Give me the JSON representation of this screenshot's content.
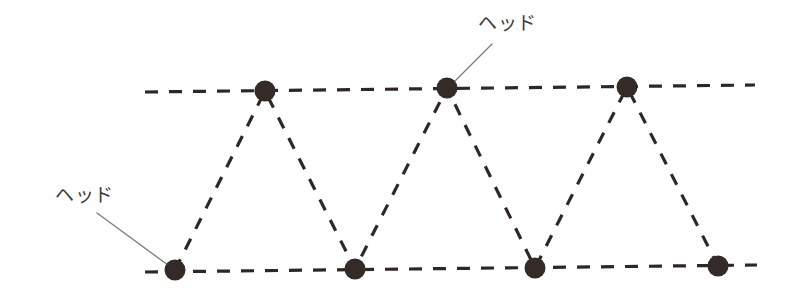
{
  "diagram": {
    "background_color": "#ffffff",
    "node_color": "#342a28",
    "line_color": "#2f2724",
    "leader_color": "#7d7a78",
    "text_color": "#413a39",
    "width": 791,
    "height": 306,
    "labels": [
      {
        "id": "head-top",
        "text": "ヘッド",
        "x": 478,
        "y": 14,
        "leader": {
          "x1": 492,
          "y1": 44,
          "x2": 452,
          "y2": 84
        }
      },
      {
        "id": "head-bottom",
        "text": "ヘッド",
        "x": 55,
        "y": 186,
        "leader": {
          "x1": 97,
          "y1": 213,
          "x2": 172,
          "y2": 268
        }
      }
    ],
    "rails": [
      {
        "id": "top-rail",
        "x1": 145,
        "y1": 92,
        "x2": 755,
        "y2": 85
      },
      {
        "id": "bottom-rail",
        "x1": 145,
        "y1": 272,
        "x2": 757,
        "y2": 265
      }
    ],
    "nodes_top": [
      {
        "id": "top-node-1",
        "x": 265,
        "y": 91,
        "r": 10
      },
      {
        "id": "top-node-2",
        "x": 447,
        "y": 88,
        "r": 10
      },
      {
        "id": "top-node-3",
        "x": 627,
        "y": 87,
        "r": 10
      }
    ],
    "nodes_bottom": [
      {
        "id": "bottom-node-1",
        "x": 175,
        "y": 270,
        "r": 10
      },
      {
        "id": "bottom-node-2",
        "x": 355,
        "y": 269,
        "r": 10
      },
      {
        "id": "bottom-node-3",
        "x": 535,
        "y": 268,
        "r": 10
      },
      {
        "id": "bottom-node-4",
        "x": 718,
        "y": 266,
        "r": 10
      }
    ],
    "zigzag_path": "M 175 270 L 265 91 L 355 269 L 447 88 L 535 268 L 627 87 L 718 266",
    "dash_pattern_rail": "13 11",
    "dash_pattern_zigzag": "12 11",
    "stroke_width": 3.2
  }
}
